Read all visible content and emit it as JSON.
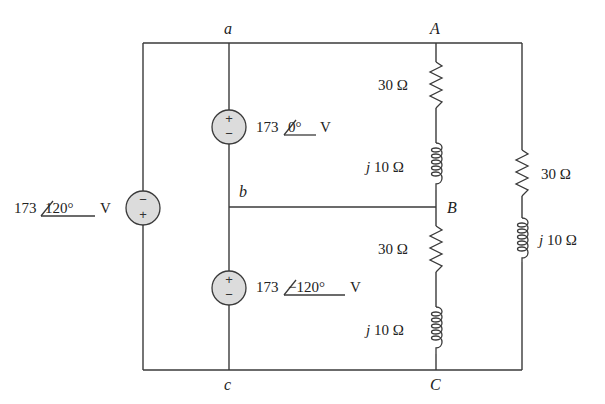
{
  "diagram": {
    "nodes": {
      "a": "a",
      "b": "b",
      "c": "c",
      "A": "A",
      "B": "B",
      "C": "C"
    },
    "sources": [
      {
        "id": "vab",
        "magnitude": "173",
        "angle": "0°",
        "unit": "V",
        "polarity_top": "+",
        "polarity_bottom": "−"
      },
      {
        "id": "vbc",
        "magnitude": "173",
        "angle": "−120°",
        "unit": "V",
        "polarity_top": "+",
        "polarity_bottom": "−"
      },
      {
        "id": "vca",
        "magnitude": "173",
        "angle": "120°",
        "unit": "V",
        "polarity_top": "−",
        "polarity_bottom": "+"
      }
    ],
    "impedances": [
      {
        "id": "r_AB",
        "label": "30 Ω"
      },
      {
        "id": "l_AB_j",
        "label": "j",
        "value": "10 Ω"
      },
      {
        "id": "r_BC",
        "label": "30 Ω"
      },
      {
        "id": "l_BC_j",
        "label": "j",
        "value": "10 Ω"
      },
      {
        "id": "r_CA",
        "label": "30 Ω"
      },
      {
        "id": "l_CA_j",
        "label": "j",
        "value": "10 Ω"
      }
    ]
  }
}
